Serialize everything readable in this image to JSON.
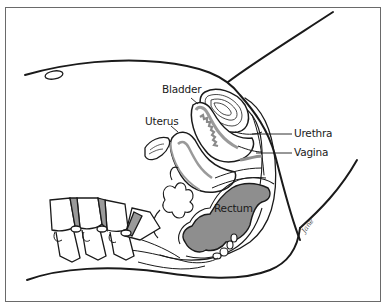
{
  "diagram": {
    "type": "anatomical-illustration",
    "labels": [
      {
        "id": "bladder",
        "text": "Bladder"
      },
      {
        "id": "uterus",
        "text": "Uterus"
      },
      {
        "id": "urethra",
        "text": "Urethra"
      },
      {
        "id": "vagina",
        "text": "Vagina"
      },
      {
        "id": "rectum",
        "text": "Rectum"
      }
    ],
    "signature": "Jane",
    "colors": {
      "line": "#1a1a1a",
      "fill_gray": "#9a9a9a",
      "rectum_fill": "#8e8e8e",
      "frame": "#6a6a6a",
      "background": "#ffffff"
    }
  }
}
